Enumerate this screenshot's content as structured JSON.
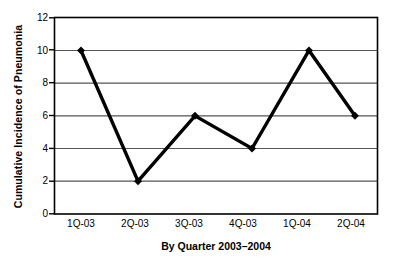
{
  "chart_data": {
    "type": "line",
    "title": "",
    "xlabel": "By Quarter 2003–2004",
    "ylabel": "Cumulative Incidence of Pneumonia",
    "categories": [
      "1Q-03",
      "2Q-03",
      "3Q-03",
      "4Q-03",
      "1Q-04",
      "2Q-04"
    ],
    "values": [
      10,
      2,
      6,
      4,
      10,
      6
    ],
    "series": [
      {
        "name": "Cumulative Incidence of Pneumonia",
        "values": [
          10,
          2,
          6,
          4,
          10,
          6
        ]
      }
    ],
    "ylim": [
      0,
      12
    ],
    "ytick_labels": [
      "0",
      "2",
      "4",
      "6",
      "8",
      "10",
      "12"
    ],
    "ytick_values": [
      0,
      2,
      4,
      6,
      8,
      10,
      12
    ],
    "grid": "horizontal",
    "legend": "none",
    "marker": "diamond",
    "line_color": "#000000",
    "marker_color": "#000000",
    "axis_color": "#000000",
    "grid_color": "#555555",
    "background_color": "#ffffff"
  },
  "axes": {
    "y_title": "Cumulative Incidence of Pneumonia",
    "x_title": "By Quarter 2003–2004",
    "y_ticks": [
      "12",
      "10",
      "8",
      "6",
      "4",
      "2",
      "0"
    ],
    "x_ticks": [
      "1Q-03",
      "2Q-03",
      "3Q-03",
      "4Q-03",
      "1Q-04",
      "2Q-04"
    ]
  }
}
